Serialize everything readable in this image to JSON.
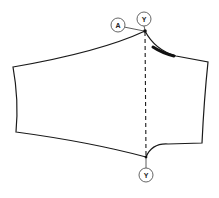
{
  "diagram": {
    "type": "sewing-pattern-sleeve",
    "colors": {
      "line": "#1a1a1a",
      "circle_stroke": "#555555",
      "background": "#ffffff"
    },
    "labels": {
      "point_a": "A",
      "point_y_top": "Y",
      "point_y_bottom": "Y"
    }
  }
}
